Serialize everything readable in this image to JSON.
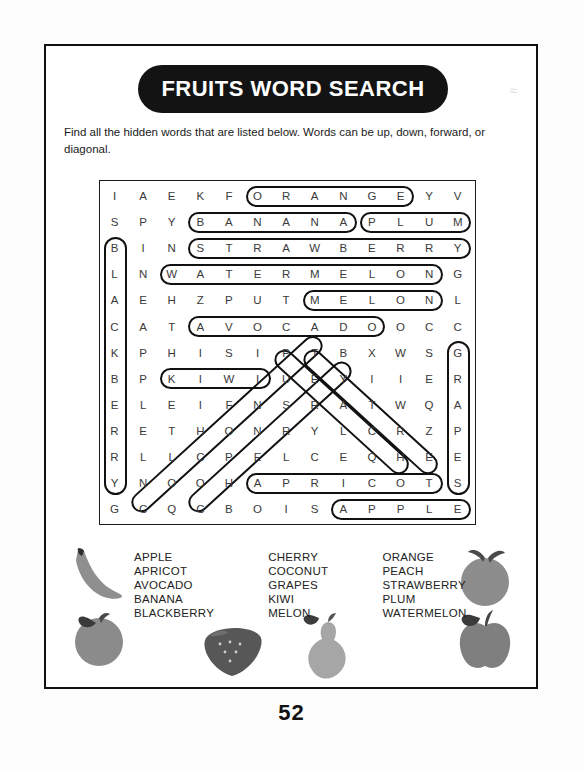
{
  "page": {
    "number": "52",
    "ghost_mark": "≈"
  },
  "header": {
    "title": "FRUITS WORD SEARCH",
    "instructions": "Find all the hidden words that are listed below. Words can be up, down, forward, or diagonal."
  },
  "puzzle": {
    "rows": 13,
    "cols": 13,
    "grid": [
      [
        "I",
        "A",
        "E",
        "K",
        "F",
        "O",
        "R",
        "A",
        "N",
        "G",
        "E",
        "Y",
        "V"
      ],
      [
        "S",
        "P",
        "Y",
        "B",
        "A",
        "N",
        "A",
        "N",
        "A",
        "P",
        "L",
        "U",
        "M"
      ],
      [
        "B",
        "I",
        "N",
        "S",
        "T",
        "R",
        "A",
        "W",
        "B",
        "E",
        "R",
        "R",
        "Y"
      ],
      [
        "L",
        "N",
        "W",
        "A",
        "T",
        "E",
        "R",
        "M",
        "E",
        "L",
        "O",
        "N",
        "G"
      ],
      [
        "A",
        "E",
        "H",
        "Z",
        "P",
        "U",
        "T",
        "M",
        "E",
        "L",
        "O",
        "N",
        "L"
      ],
      [
        "C",
        "A",
        "T",
        "A",
        "V",
        "O",
        "C",
        "A",
        "D",
        "O",
        "O",
        "C",
        "C"
      ],
      [
        "K",
        "P",
        "H",
        "I",
        "S",
        "I",
        "P",
        "T",
        "B",
        "X",
        "W",
        "S",
        "G"
      ],
      [
        "B",
        "P",
        "K",
        "I",
        "W",
        "I",
        "U",
        "E",
        "Y",
        "I",
        "I",
        "E",
        "R"
      ],
      [
        "E",
        "L",
        "E",
        "I",
        "F",
        "N",
        "S",
        "R",
        "A",
        "T",
        "W",
        "Q",
        "A"
      ],
      [
        "R",
        "E",
        "T",
        "H",
        "O",
        "N",
        "R",
        "Y",
        "L",
        "C",
        "R",
        "Z",
        "P"
      ],
      [
        "R",
        "L",
        "L",
        "C",
        "P",
        "E",
        "L",
        "C",
        "E",
        "Q",
        "H",
        "E",
        "E"
      ],
      [
        "Y",
        "N",
        "O",
        "O",
        "H",
        "A",
        "P",
        "R",
        "I",
        "C",
        "O",
        "T",
        "S"
      ],
      [
        "G",
        "C",
        "Q",
        "C",
        "B",
        "O",
        "I",
        "S",
        "A",
        "P",
        "P",
        "L",
        "E"
      ]
    ],
    "found_words": [
      {
        "word": "ORANGE",
        "direction": "horizontal",
        "row": 0,
        "col": 5,
        "length": 6
      },
      {
        "word": "BANANA",
        "direction": "horizontal",
        "row": 1,
        "col": 3,
        "length": 6
      },
      {
        "word": "PLUM",
        "direction": "horizontal",
        "row": 1,
        "col": 9,
        "length": 4
      },
      {
        "word": "STRAWBERRY",
        "direction": "horizontal",
        "row": 2,
        "col": 3,
        "length": 10
      },
      {
        "word": "WATERMELON",
        "direction": "horizontal",
        "row": 3,
        "col": 2,
        "length": 10
      },
      {
        "word": "MELON",
        "direction": "horizontal",
        "row": 4,
        "col": 7,
        "length": 5
      },
      {
        "word": "AVOCADO",
        "direction": "horizontal",
        "row": 5,
        "col": 3,
        "length": 7
      },
      {
        "word": "KIWI",
        "direction": "horizontal",
        "row": 7,
        "col": 2,
        "length": 4
      },
      {
        "word": "APRICOT",
        "direction": "horizontal",
        "row": 11,
        "col": 5,
        "length": 7
      },
      {
        "word": "APPLE",
        "direction": "horizontal",
        "row": 12,
        "col": 8,
        "length": 5
      },
      {
        "word": "BLACKBERRY",
        "direction": "vertical",
        "row": 2,
        "col": 0,
        "length": 10
      },
      {
        "word": "GRAPES",
        "direction": "vertical",
        "row": 6,
        "col": 12,
        "length": 6
      },
      {
        "word": "COCONUT",
        "direction": "diagonal-up-right",
        "row": 12,
        "col": 1,
        "length": 7
      },
      {
        "word": "CHERRY",
        "direction": "diagonal-up-right",
        "row": 12,
        "col": 3,
        "length": 6
      },
      {
        "word": "PEACH",
        "direction": "diagonal-down-right",
        "row": 6,
        "col": 6,
        "length": 5
      },
      {
        "word": "TYLCH",
        "direction": "diagonal-down-right",
        "row": 6,
        "col": 7,
        "length": 5
      }
    ]
  },
  "wordlist": {
    "columns": [
      [
        "APPLE",
        "APRICOT",
        "AVOCADO",
        "BANANA",
        "BLACKBERRY"
      ],
      [
        "CHERRY",
        "COCONUT",
        "GRAPES",
        "KIWI",
        "MELON"
      ],
      [
        "ORANGE",
        "PEACH",
        "STRAWBERRY",
        "PLUM",
        "WATERMELON"
      ]
    ]
  },
  "illustrations": [
    {
      "name": "banana",
      "x": 60,
      "y": 540
    },
    {
      "name": "peach",
      "x": 62,
      "y": 605
    },
    {
      "name": "strawberry",
      "x": 195,
      "y": 615
    },
    {
      "name": "pear",
      "x": 295,
      "y": 610
    },
    {
      "name": "apple-top-right",
      "x": 450,
      "y": 538
    },
    {
      "name": "apple-bottom-right",
      "x": 450,
      "y": 600
    }
  ],
  "colors": {
    "ink": "#111111",
    "letter": "#3a3a3a",
    "fruit_gray": "#8d8d8d",
    "fruit_dark": "#6a6a6a"
  }
}
